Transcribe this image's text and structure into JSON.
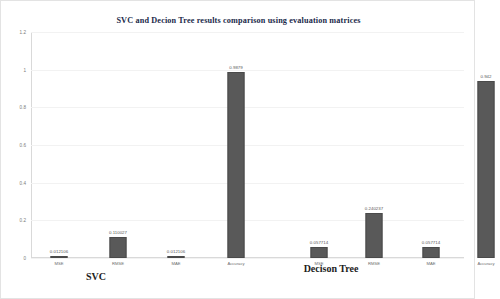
{
  "chart_data": {
    "type": "bar",
    "title": "SVC and Decion Tree results comparison using evaluation matrices",
    "xlabel": "",
    "ylabel": "",
    "ylim": [
      0,
      1.2
    ],
    "ytick_labels": [
      "0",
      "0.2",
      "0.4",
      "0.6",
      "0.8",
      "1",
      "1.2"
    ],
    "ytick_values": [
      0,
      0.2,
      0.4,
      0.6,
      0.8,
      1,
      1.2
    ],
    "grid": true,
    "legend": "none",
    "bar_color": "#595959",
    "title_color": "#1b2a4a",
    "groups": [
      {
        "name": "SVC",
        "categories": [
          "MSE",
          "RMSE",
          "MAE",
          "Accuracy"
        ],
        "values": [
          0.012106,
          0.110027,
          0.012106,
          0.9879
        ],
        "value_labels": [
          "0.012106",
          "0.110027",
          "0.012106",
          "0.9879"
        ]
      },
      {
        "name": "Decison Tree",
        "categories": [
          "MSE",
          "RMSE",
          "MAE",
          "Accuracy"
        ],
        "values": [
          0.057714,
          0.240237,
          0.057714,
          0.942
        ],
        "value_labels": [
          "0.057714",
          "0.240237",
          "0.057714",
          "0.942"
        ]
      }
    ]
  }
}
